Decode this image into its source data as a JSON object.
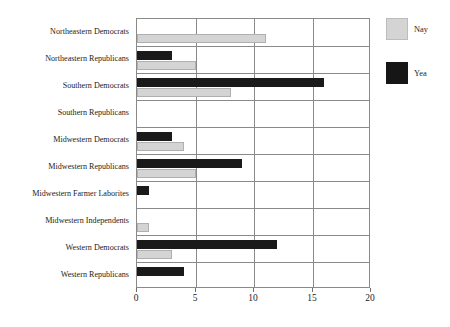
{
  "chart_data": {
    "type": "bar",
    "orientation": "horizontal",
    "title": "",
    "xlabel": "",
    "ylabel": "",
    "xlim": [
      0,
      20
    ],
    "xticks": [
      0,
      5,
      10,
      15,
      20
    ],
    "xtick_labels": [
      "0",
      "5",
      "10",
      "15",
      "20"
    ],
    "grid": true,
    "legend_position": "right",
    "categories": [
      "Northeastern Democrats",
      "Northeastern Republicans",
      "Southern Democrats",
      "Southern Republicans",
      "Midwestern Democrats",
      "Midwestern Republicans",
      "Midwestern Farmer Laborites",
      "Midwestern Independents",
      "Western Democrats",
      "Western Republicans"
    ],
    "series": [
      {
        "name": "Nay",
        "color": "#d4d4d4",
        "values": [
          11,
          5,
          8,
          0,
          4,
          5,
          0,
          1,
          3,
          0
        ]
      },
      {
        "name": "Yea",
        "color": "#161616",
        "values": [
          0,
          3,
          16,
          0,
          3,
          9,
          1,
          0,
          12,
          4
        ]
      }
    ]
  },
  "legend": {
    "entries": [
      {
        "label": "Nay",
        "swatch": "nay"
      },
      {
        "label": "Yea",
        "swatch": "yea"
      }
    ]
  }
}
